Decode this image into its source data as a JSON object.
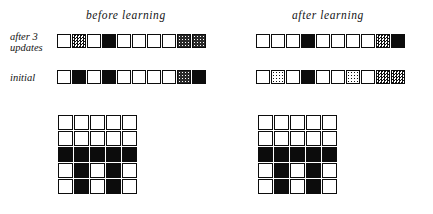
{
  "figure": {
    "headings": {
      "before": "before  learning",
      "after": "after  learning"
    },
    "row_labels": {
      "updates": "after 3\nupdates",
      "initial": "initial"
    }
  },
  "chart_data": {
    "type": "heatmap",
    "title": "",
    "shade_scale": {
      "levels": [
        0,
        1,
        2,
        3,
        4
      ],
      "labels": [
        "white",
        "light gray",
        "medium gray",
        "dark gray",
        "black"
      ],
      "colors": [
        "#ffffff",
        "#d0d0d0",
        "#909090",
        "#404040",
        "#0c0c0c"
      ]
    },
    "columns": [
      "before learning",
      "after learning"
    ],
    "rows": [
      "after 3 updates",
      "initial"
    ],
    "vectors": {
      "before_updates": [
        0,
        2,
        0,
        4,
        0,
        0,
        0,
        0,
        3,
        3
      ],
      "before_initial": [
        0,
        4,
        0,
        4,
        0,
        0,
        0,
        0,
        3,
        4
      ],
      "after_updates": [
        0,
        0,
        0,
        4,
        0,
        0,
        0,
        0,
        2,
        4
      ],
      "after_initial": [
        0,
        1,
        0,
        4,
        0,
        0,
        1,
        0,
        2,
        2
      ]
    },
    "grids": {
      "before": [
        [
          0,
          0,
          0,
          0,
          0
        ],
        [
          0,
          0,
          0,
          0,
          0
        ],
        [
          4,
          4,
          4,
          4,
          4
        ],
        [
          0,
          4,
          0,
          4,
          0
        ],
        [
          0,
          4,
          0,
          4,
          0
        ]
      ],
      "after": [
        [
          0,
          0,
          0,
          0,
          0
        ],
        [
          0,
          0,
          0,
          0,
          0
        ],
        [
          4,
          4,
          4,
          4,
          4
        ],
        [
          0,
          4,
          0,
          4,
          0
        ],
        [
          0,
          4,
          0,
          4,
          0
        ]
      ]
    },
    "grid_size": [
      5,
      5
    ],
    "vector_length": 10
  }
}
